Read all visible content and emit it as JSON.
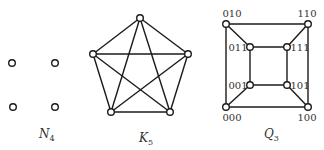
{
  "graphs": [
    {
      "name": "N4",
      "label": "N",
      "subscript": "4",
      "label_pos": [
        39,
        138
      ],
      "nodes": [
        [
          12,
          63
        ],
        [
          55,
          63
        ],
        [
          13,
          107
        ],
        [
          55,
          107
        ]
      ],
      "edges": []
    },
    {
      "name": "K5",
      "label": "K",
      "subscript": "5",
      "label_pos": [
        139,
        142
      ],
      "nodes": [
        [
          140,
          18
        ],
        [
          93,
          54
        ],
        [
          188,
          54
        ],
        [
          111,
          112
        ],
        [
          170,
          112
        ]
      ],
      "edges": [
        [
          0,
          1
        ],
        [
          0,
          2
        ],
        [
          0,
          3
        ],
        [
          0,
          4
        ],
        [
          1,
          2
        ],
        [
          1,
          3
        ],
        [
          1,
          4
        ],
        [
          2,
          3
        ],
        [
          2,
          4
        ],
        [
          3,
          4
        ]
      ]
    },
    {
      "name": "Q3",
      "label": "Q",
      "subscript": "3",
      "label_pos": [
        264,
        138
      ],
      "nodes": [
        [
          226,
          24
        ],
        [
          308,
          24
        ],
        [
          250,
          47
        ],
        [
          287,
          47
        ],
        [
          250,
          85
        ],
        [
          287,
          85
        ],
        [
          226,
          107
        ],
        [
          308,
          107
        ]
      ],
      "node_labels": [
        "010",
        "110",
        "011",
        "111",
        "001",
        "101",
        "000",
        "100"
      ],
      "node_label_pos": [
        [
          226,
          17
        ],
        [
          301,
          17
        ],
        [
          229,
          51
        ],
        [
          289,
          51
        ],
        [
          229,
          89
        ],
        [
          289,
          89
        ],
        [
          226,
          121
        ],
        [
          301,
          121
        ]
      ],
      "edges": [
        [
          0,
          1
        ],
        [
          0,
          6
        ],
        [
          1,
          7
        ],
        [
          6,
          7
        ],
        [
          2,
          3
        ],
        [
          2,
          4
        ],
        [
          3,
          5
        ],
        [
          4,
          5
        ],
        [
          0,
          2
        ],
        [
          1,
          3
        ],
        [
          6,
          4
        ],
        [
          7,
          5
        ]
      ]
    }
  ]
}
